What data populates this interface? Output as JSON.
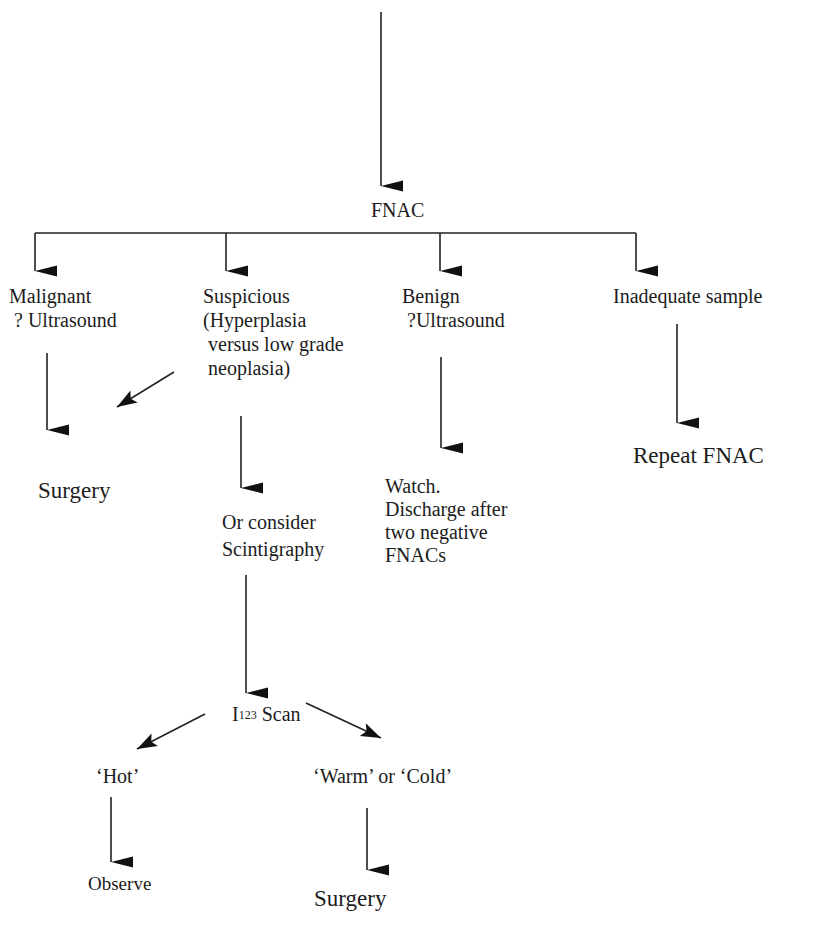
{
  "diagram": {
    "type": "flowchart",
    "top_heading_cutoff": "(heading text cut off at top edge)",
    "colors": {
      "line": "#222222",
      "text": "#1c1c1c",
      "background": "#ffffff"
    },
    "nodes": {
      "fnac": {
        "label": "FNAC"
      },
      "malignant": {
        "lines": [
          "Malignant",
          "? Ultrasound"
        ]
      },
      "suspicious": {
        "lines": [
          "Suspicious",
          "(Hyperplasia",
          "versus low grade",
          "neoplasia)"
        ]
      },
      "benign": {
        "lines": [
          "Benign",
          "?Ultrasound"
        ]
      },
      "inadequate": {
        "label": "Inadequate sample"
      },
      "surgery_left": {
        "label": "Surgery"
      },
      "repeat_fnac": {
        "label": "Repeat FNAC"
      },
      "or_consider": {
        "lines": [
          "Or consider",
          "Scintigraphy"
        ]
      },
      "watch": {
        "lines": [
          "Watch.",
          "Discharge after",
          "two negative",
          "FNACs"
        ]
      },
      "i123_scan": {
        "base": "I",
        "superscript": "123",
        "suffix": " Scan"
      },
      "hot": {
        "label": "‘Hot’"
      },
      "warm_cold": {
        "label": "‘Warm’ or ‘Cold’"
      },
      "observe": {
        "label": "Observe"
      },
      "surgery_bottom": {
        "label": "Surgery"
      }
    },
    "edges": [
      {
        "from": "top",
        "to": "fnac"
      },
      {
        "from": "fnac",
        "to": "malignant"
      },
      {
        "from": "fnac",
        "to": "suspicious"
      },
      {
        "from": "fnac",
        "to": "benign"
      },
      {
        "from": "fnac",
        "to": "inadequate"
      },
      {
        "from": "malignant",
        "to": "surgery_left"
      },
      {
        "from": "suspicious",
        "to": "surgery_left"
      },
      {
        "from": "suspicious",
        "to": "or_consider"
      },
      {
        "from": "benign",
        "to": "watch"
      },
      {
        "from": "inadequate",
        "to": "repeat_fnac"
      },
      {
        "from": "or_consider",
        "to": "i123_scan"
      },
      {
        "from": "i123_scan",
        "to": "hot"
      },
      {
        "from": "i123_scan",
        "to": "warm_cold"
      },
      {
        "from": "hot",
        "to": "observe"
      },
      {
        "from": "warm_cold",
        "to": "surgery_bottom"
      }
    ]
  }
}
